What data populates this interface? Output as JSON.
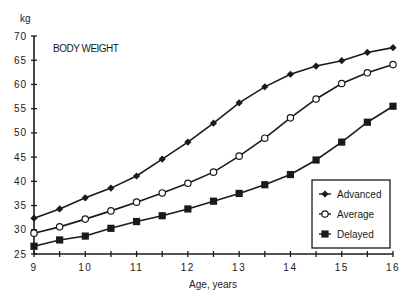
{
  "chart_data": {
    "type": "line",
    "title": "BODY WEIGHT",
    "xlabel": "Age, years",
    "ylabel": "kg",
    "xlim": [
      9,
      16
    ],
    "ylim": [
      25,
      70
    ],
    "x_ticks": [
      9,
      10,
      11,
      12,
      13,
      14,
      15,
      16
    ],
    "x_minor_step": 0.5,
    "y_ticks": [
      25,
      30,
      35,
      40,
      45,
      50,
      55,
      60,
      65,
      70
    ],
    "grid": false,
    "legend_position": "bottom-right",
    "x": [
      9,
      9.5,
      10,
      10.5,
      11,
      11.5,
      12,
      12.5,
      13,
      13.5,
      14,
      14.5,
      15,
      15.5,
      16
    ],
    "series": [
      {
        "name": "Advanced",
        "marker": "filled-diamond",
        "values": [
          32.4,
          34.3,
          36.6,
          38.6,
          41.1,
          44.6,
          48.1,
          52.0,
          56.2,
          59.5,
          62.1,
          63.8,
          64.9,
          66.6,
          67.6
        ]
      },
      {
        "name": "Average",
        "marker": "open-circle",
        "values": [
          29.3,
          30.6,
          32.2,
          33.9,
          35.7,
          37.6,
          39.6,
          41.9,
          45.2,
          48.9,
          53.1,
          57.0,
          60.2,
          62.4,
          64.1
        ]
      },
      {
        "name": "Delayed",
        "marker": "filled-square",
        "values": [
          26.6,
          27.9,
          28.7,
          30.3,
          31.7,
          32.9,
          34.3,
          35.9,
          37.5,
          39.3,
          41.4,
          44.4,
          48.1,
          52.2,
          55.5
        ]
      }
    ]
  }
}
